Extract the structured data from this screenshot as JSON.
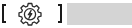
{
  "control": {
    "icon": "gear-lightning-icon",
    "icon_label": "power settings",
    "stroke_color": "#2b2b2b",
    "bracket_color": "#1a1a1a"
  },
  "value_field": {
    "fill_color": "#d4d4d4",
    "value": ""
  }
}
